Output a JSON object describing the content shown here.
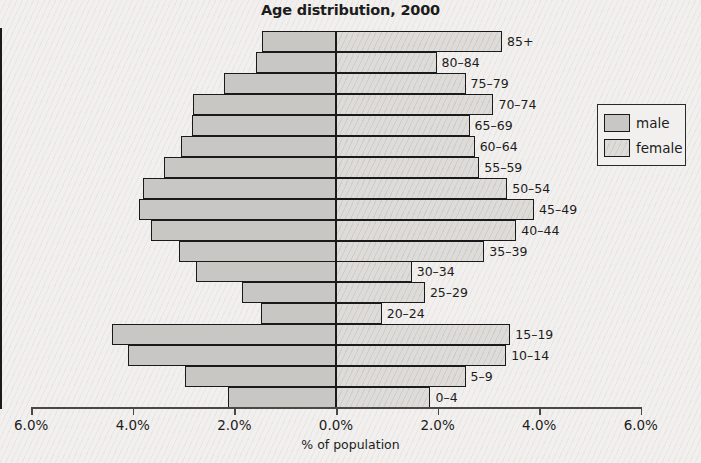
{
  "chart_data": {
    "type": "bar",
    "title": "Age distribution, 2000",
    "xlabel": "% of population",
    "ylabel": "",
    "orientation": "horizontal-diverging",
    "xlim": [
      -6.0,
      6.0
    ],
    "grid": false,
    "legend_position": "right",
    "tick_labels": [
      "6.0%",
      "4.0%",
      "2.0%",
      "0.0%",
      "2.0%",
      "4.0%",
      "6.0%"
    ],
    "tick_values": [
      -6.0,
      -4.0,
      -2.0,
      0.0,
      2.0,
      4.0,
      6.0
    ],
    "categories": [
      "85+",
      "80–84",
      "75–79",
      "70–74",
      "65–69",
      "60–64",
      "55–59",
      "50–54",
      "45–49",
      "40–44",
      "35–39",
      "30–34",
      "25–29",
      "20–24",
      "15–19",
      "10–14",
      "5–9",
      "0–4"
    ],
    "series": [
      {
        "name": "male",
        "color": "#c9c7c4",
        "side": "left",
        "values": [
          1.45,
          1.57,
          2.2,
          2.82,
          2.84,
          3.06,
          3.39,
          3.8,
          3.88,
          3.65,
          3.1,
          2.75,
          1.86,
          1.47,
          4.41,
          4.1,
          2.98,
          2.12
        ]
      },
      {
        "name": "female",
        "color": "#dedcd9",
        "side": "right",
        "values": [
          3.27,
          1.98,
          2.55,
          3.1,
          2.63,
          2.73,
          2.82,
          3.37,
          3.9,
          3.55,
          2.92,
          1.49,
          1.75,
          0.9,
          3.43,
          3.35,
          2.55,
          1.86
        ]
      }
    ]
  },
  "legend": {
    "items": [
      {
        "label": "male",
        "swatch": "male-swatch"
      },
      {
        "label": "female",
        "swatch": "female-swatch"
      }
    ]
  }
}
